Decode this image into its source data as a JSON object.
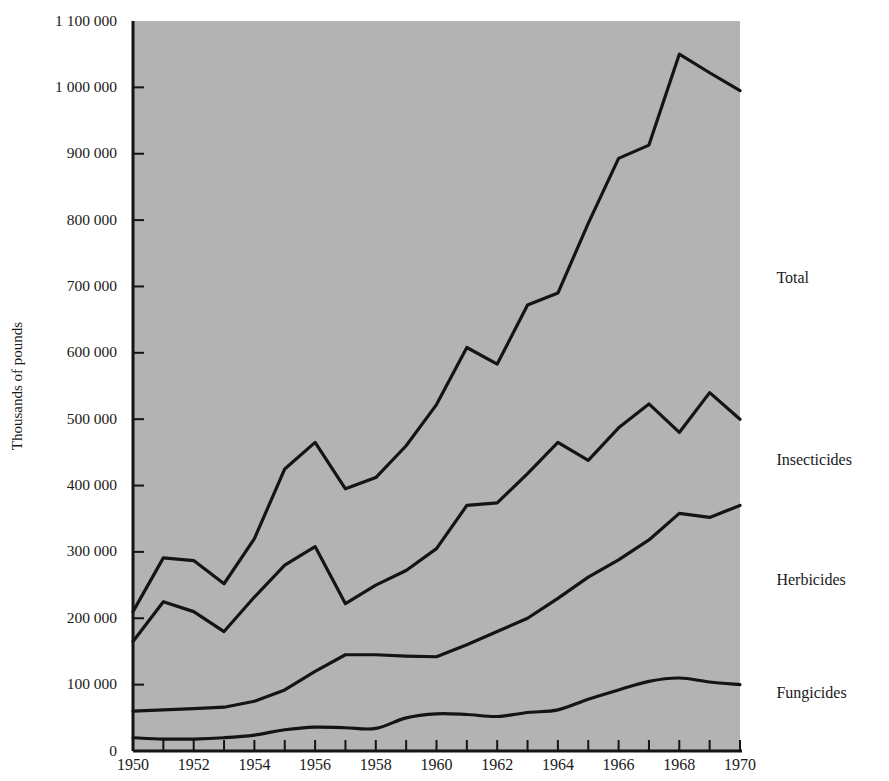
{
  "chart_data": {
    "type": "line",
    "title": "",
    "xlabel": "",
    "ylabel": "Thousands of pounds",
    "xlim": [
      1950,
      1970
    ],
    "ylim": [
      0,
      1100000
    ],
    "grid": false,
    "legend_position": "right-inline",
    "x": [
      1950,
      1951,
      1952,
      1953,
      1954,
      1955,
      1956,
      1957,
      1958,
      1959,
      1960,
      1961,
      1962,
      1963,
      1964,
      1965,
      1966,
      1967,
      1968,
      1969,
      1970
    ],
    "ytick_labels": [
      "0",
      "100 000",
      "200 000",
      "300 000",
      "400 000",
      "500 000",
      "600 000",
      "700 000",
      "800 000",
      "900 000",
      "1 000 000",
      "1 100 000"
    ],
    "ytick_values": [
      0,
      100000,
      200000,
      300000,
      400000,
      500000,
      600000,
      700000,
      800000,
      900000,
      1000000,
      1100000
    ],
    "xtick_labels": [
      "1950",
      "1952",
      "1954",
      "1956",
      "1958",
      "1960",
      "1962",
      "1964",
      "1966",
      "1968",
      "1970"
    ],
    "xtick_values": [
      1950,
      1952,
      1954,
      1956,
      1958,
      1960,
      1962,
      1964,
      1966,
      1968,
      1970
    ],
    "xminor_values": [
      1951,
      1953,
      1955,
      1957,
      1959,
      1961,
      1963,
      1965,
      1967,
      1969
    ],
    "series": [
      {
        "name": "Total",
        "label": "Total",
        "smooth": false,
        "label_x": 1971.2,
        "label_y": 710000,
        "values": [
          210000,
          291000,
          287000,
          252000,
          320000,
          425000,
          465000,
          395000,
          412000,
          460000,
          522000,
          608000,
          583000,
          672000,
          690000,
          795000,
          893000,
          913000,
          1050000,
          1022000,
          995000
        ]
      },
      {
        "name": "Insecticides",
        "label": "Insecticides",
        "smooth": false,
        "label_x": 1971.2,
        "label_y": 437000,
        "values": [
          165000,
          225000,
          210000,
          180000,
          232000,
          280000,
          308000,
          222000,
          250000,
          272000,
          305000,
          370000,
          374000,
          418000,
          465000,
          438000,
          487000,
          523000,
          480000,
          540000,
          500000
        ]
      },
      {
        "name": "Herbicides",
        "label": "Herbicides",
        "smooth": false,
        "label_x": 1971.2,
        "label_y": 255000,
        "values": [
          60000,
          62000,
          64000,
          66000,
          75000,
          92000,
          120000,
          145000,
          145000,
          143000,
          142000,
          160000,
          180000,
          200000,
          230000,
          262000,
          288000,
          318000,
          358000,
          352000,
          370000
        ]
      },
      {
        "name": "Fungicides",
        "label": "Fungicides",
        "smooth": true,
        "label_x": 1971.2,
        "label_y": 85000,
        "values": [
          20000,
          18000,
          18000,
          20000,
          24000,
          32000,
          36000,
          35000,
          34000,
          50000,
          56000,
          55000,
          52000,
          58000,
          62000,
          78000,
          92000,
          105000,
          110000,
          104000,
          100000
        ]
      }
    ],
    "colors": {
      "plot_background": "#b3b3b3",
      "line": "#141414",
      "axis": "#141414",
      "page_background": "#ffffff",
      "text": "#1a1a1a"
    }
  }
}
